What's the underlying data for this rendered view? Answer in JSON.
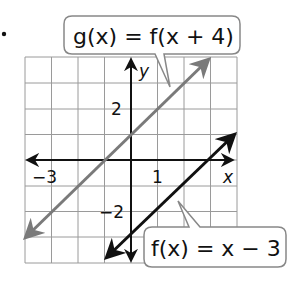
{
  "figure": {
    "bullet": ".",
    "axes": {
      "x_label": "x",
      "y_label": "y",
      "x_range": [
        -4,
        4
      ],
      "y_range": [
        -4,
        4
      ],
      "grid": true,
      "tick_labels": {
        "x_neg3": "−3",
        "x_1": "1",
        "y_2": "2",
        "y_neg2": "−2"
      }
    },
    "lines": [
      {
        "name": "f",
        "equation_label": "f(x) = x − 3",
        "slope": 1,
        "intercept": -3,
        "color": "#111111"
      },
      {
        "name": "g",
        "equation_label": "g(x) = f(x + 4)",
        "slope": 1,
        "intercept": 1,
        "color": "#7a7a7a"
      }
    ],
    "callouts": {
      "g_label": "g(x) = f(x + 4)",
      "f_label": "f(x) = x − 3"
    }
  }
}
